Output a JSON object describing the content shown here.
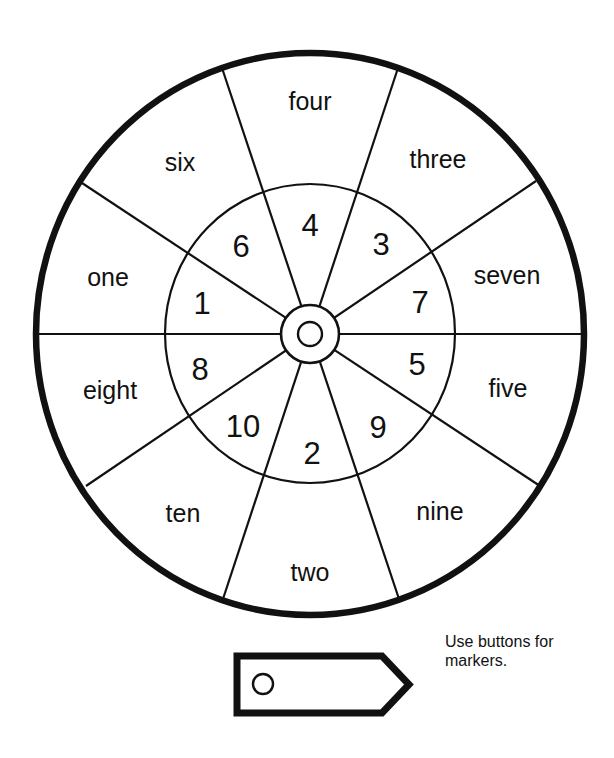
{
  "wheel": {
    "outer_segments": [
      {
        "label": "four",
        "x": 310,
        "y": 110
      },
      {
        "label": "three",
        "x": 438,
        "y": 168
      },
      {
        "label": "seven",
        "x": 507,
        "y": 284
      },
      {
        "label": "five",
        "x": 508,
        "y": 397
      },
      {
        "label": "nine",
        "x": 440,
        "y": 520
      },
      {
        "label": "two",
        "x": 310,
        "y": 581
      },
      {
        "label": "ten",
        "x": 183,
        "y": 522
      },
      {
        "label": "eight",
        "x": 110,
        "y": 399
      },
      {
        "label": "one",
        "x": 108,
        "y": 286
      },
      {
        "label": "six",
        "x": 180,
        "y": 171
      }
    ],
    "inner_segments": [
      {
        "label": "4",
        "x": 310,
        "y": 236
      },
      {
        "label": "3",
        "x": 381,
        "y": 255
      },
      {
        "label": "7",
        "x": 420,
        "y": 313
      },
      {
        "label": "5",
        "x": 417,
        "y": 375
      },
      {
        "label": "9",
        "x": 378,
        "y": 438
      },
      {
        "label": "2",
        "x": 312,
        "y": 464
      },
      {
        "label": "10",
        "x": 243,
        "y": 437
      },
      {
        "label": "8",
        "x": 200,
        "y": 380
      },
      {
        "label": "1",
        "x": 202,
        "y": 314
      },
      {
        "label": "6",
        "x": 241,
        "y": 257
      }
    ]
  },
  "marker": {
    "note": "Use buttons for markers."
  },
  "colors": {
    "ink": "#111111",
    "background": "#ffffff"
  }
}
